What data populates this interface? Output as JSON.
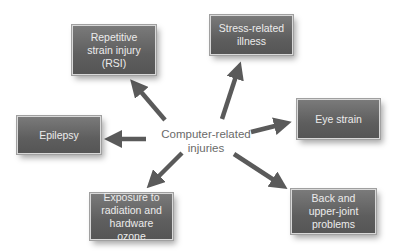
{
  "diagram": {
    "center": {
      "line1": "Computer-related",
      "line2": "injuries"
    },
    "nodes": [
      {
        "id": "rsi",
        "lines": [
          "Repetitive",
          "strain injury",
          "(RSI)"
        ]
      },
      {
        "id": "stress",
        "lines": [
          "Stress-related",
          "illness"
        ]
      },
      {
        "id": "epilepsy",
        "lines": [
          "Epilepsy"
        ]
      },
      {
        "id": "eye",
        "lines": [
          "Eye strain"
        ]
      },
      {
        "id": "exposure",
        "lines": [
          "Exposure to",
          "radiation and",
          "hardware ozone"
        ]
      },
      {
        "id": "back",
        "lines": [
          "Back and",
          "upper-joint",
          "problems"
        ]
      }
    ],
    "colors": {
      "box": "#666666",
      "box_text": "#ececec",
      "arrow": "#5a5a5a",
      "center_text": "#6a6a6a"
    }
  }
}
